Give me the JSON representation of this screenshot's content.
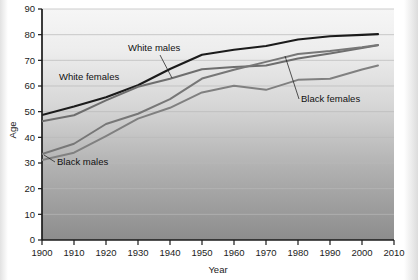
{
  "chart_data": {
    "type": "line",
    "title": "",
    "xlabel": "Year",
    "ylabel": "Age",
    "xlim": [
      1900,
      2010
    ],
    "ylim": [
      0,
      90
    ],
    "grid": true,
    "legend_position": "inline-annotations",
    "x_ticks": [
      "1900",
      "1910",
      "1920",
      "1930",
      "1940",
      "1950",
      "1960",
      "1970",
      "1980",
      "1990",
      "2000",
      "2010"
    ],
    "y_ticks": [
      "0",
      "10",
      "20",
      "30",
      "40",
      "50",
      "60",
      "70",
      "80",
      "90"
    ],
    "x": [
      1900,
      1910,
      1920,
      1930,
      1940,
      1950,
      1960,
      1970,
      1980,
      1990,
      2000,
      2005
    ],
    "series": [
      {
        "name": "White females",
        "color": "#1b1b1b",
        "width": 2.1,
        "values": [
          48.7,
          52.0,
          55.6,
          60.3,
          66.6,
          72.2,
          74.1,
          75.6,
          78.1,
          79.4,
          79.9,
          80.2
        ]
      },
      {
        "name": "White males",
        "color": "#6e6e6e",
        "width": 2.0,
        "values": [
          46.3,
          48.6,
          54.4,
          59.7,
          62.8,
          66.5,
          67.4,
          68.0,
          70.7,
          72.7,
          74.8,
          75.9
        ]
      },
      {
        "name": "Black females",
        "color": "#777777",
        "width": 2.0,
        "values": [
          33.5,
          37.5,
          45.2,
          49.2,
          54.9,
          62.9,
          66.3,
          69.4,
          72.5,
          73.6,
          75.1,
          76.0
        ]
      },
      {
        "name": "Black males",
        "color": "#808080",
        "width": 2.0,
        "values": [
          31.2,
          34.0,
          40.5,
          47.3,
          51.5,
          57.5,
          60.1,
          58.5,
          62.4,
          62.8,
          66.4,
          68.0
        ]
      }
    ],
    "annotations": [
      {
        "text": "White males",
        "label_x": 128,
        "label_y": 51,
        "leader": [
          [
            160,
            55
          ],
          [
            172,
            78
          ]
        ]
      },
      {
        "text": "White females",
        "label_x": 59,
        "label_y": 80,
        "leader": []
      },
      {
        "text": "Black females",
        "label_x": 301,
        "label_y": 102,
        "leader": [
          [
            299,
            99
          ],
          [
            285,
            56
          ]
        ]
      },
      {
        "text": "Black males",
        "label_x": 57,
        "label_y": 165,
        "leader": [
          [
            55,
            162
          ],
          [
            44,
            155
          ]
        ]
      }
    ]
  },
  "colors": {
    "plot_background_top": "#f4f4f4",
    "plot_background_bottom": "#8f8f8f",
    "axis": "#1a1a1a",
    "gridline": "#b9b9b9",
    "page_background": "#ffffff"
  }
}
